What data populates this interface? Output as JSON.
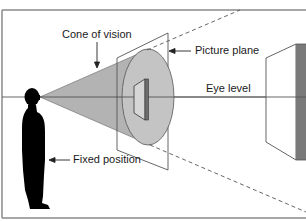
{
  "diagram": {
    "labels": {
      "cone_of_vision": "Cone of vision",
      "picture_plane": "Picture plane",
      "eye_level": "Eye level",
      "fixed_position": "Fixed position"
    },
    "colors": {
      "frame": "#8a8a8a",
      "line": "#555555",
      "cone_fill": "#b3b3b3",
      "ellipse_fill": "#c4c4c4",
      "figure": "#000000",
      "object_dark": "#7a7a7a",
      "object_side": "#ffffff"
    }
  }
}
